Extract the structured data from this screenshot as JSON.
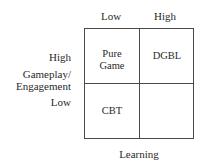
{
  "diagram": {
    "type": "2x2 quadrant matrix",
    "x_axis": {
      "title": "Learning",
      "levels": [
        "Low",
        "High"
      ]
    },
    "y_axis": {
      "title_line1": "Gameplay/",
      "title_line2": "Engagement",
      "levels": [
        "High",
        "Low"
      ]
    },
    "cells": {
      "top_left": {
        "line1": "Pure",
        "line2": "Game"
      },
      "top_right": {
        "label": "DGBL"
      },
      "bottom_left": {
        "label": "CBT"
      },
      "bottom_right": {
        "label": ""
      }
    },
    "colors": {
      "line": "#4a4a4a",
      "text": "#2a2a2a",
      "background": "#ffffff"
    }
  }
}
